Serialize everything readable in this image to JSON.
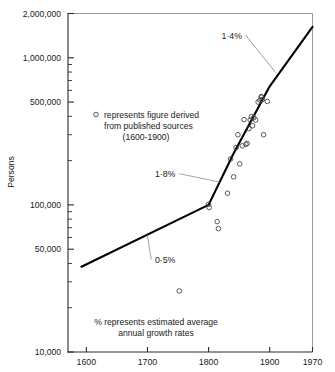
{
  "chart_data": {
    "type": "scatter",
    "title": "",
    "xlabel": "",
    "ylabel": "Persons",
    "yscale": "log",
    "ylim": [
      10000,
      2000000
    ],
    "xlim": [
      1570,
      1970
    ],
    "grid": false,
    "legend_position": "upper-left-inside",
    "ytick_labels": [
      "2,000,000",
      "1,000,000",
      "500,000",
      "100,000",
      "50,000",
      "10,000"
    ],
    "ytick_values": [
      2000000,
      1000000,
      500000,
      100000,
      50000,
      10000
    ],
    "xtick_labels": [
      "1600",
      "1700",
      "1800",
      "1900",
      "1970"
    ],
    "xtick_values": [
      1600,
      1700,
      1800,
      1900,
      1970
    ],
    "series": [
      {
        "name": "trend line",
        "type": "line",
        "points": [
          {
            "x": 1592,
            "y": 38000
          },
          {
            "x": 1800,
            "y": 100000
          },
          {
            "x": 1840,
            "y": 220000
          },
          {
            "x": 1900,
            "y": 640000
          },
          {
            "x": 1970,
            "y": 1620000
          }
        ]
      },
      {
        "name": "figure derived from published sources",
        "type": "scatter",
        "points": [
          {
            "x": 1752,
            "y": 26000
          },
          {
            "x": 1800,
            "y": 101000
          },
          {
            "x": 1801,
            "y": 96000
          },
          {
            "x": 1814,
            "y": 77000
          },
          {
            "x": 1816,
            "y": 69000
          },
          {
            "x": 1831,
            "y": 120000
          },
          {
            "x": 1836,
            "y": 205000
          },
          {
            "x": 1841,
            "y": 155000
          },
          {
            "x": 1845,
            "y": 245000
          },
          {
            "x": 1848,
            "y": 300000
          },
          {
            "x": 1851,
            "y": 190000
          },
          {
            "x": 1855,
            "y": 252000
          },
          {
            "x": 1858,
            "y": 380000
          },
          {
            "x": 1861,
            "y": 258000
          },
          {
            "x": 1863,
            "y": 262000
          },
          {
            "x": 1866,
            "y": 330000
          },
          {
            "x": 1868,
            "y": 378000
          },
          {
            "x": 1870,
            "y": 398000
          },
          {
            "x": 1872,
            "y": 345000
          },
          {
            "x": 1874,
            "y": 392000
          },
          {
            "x": 1877,
            "y": 378000
          },
          {
            "x": 1881,
            "y": 500000
          },
          {
            "x": 1884,
            "y": 515000
          },
          {
            "x": 1886,
            "y": 545000
          },
          {
            "x": 1887,
            "y": 540000
          },
          {
            "x": 1888,
            "y": 520000
          },
          {
            "x": 1890,
            "y": 300000
          },
          {
            "x": 1896,
            "y": 505000
          }
        ]
      }
    ],
    "annotations": [
      {
        "label": "1·4%",
        "text_x": 1838,
        "text_y": 1420000,
        "leader_to_x": 1910,
        "leader_to_y": 790000
      },
      {
        "label": "1·8%",
        "text_x": 1729,
        "text_y": 163000,
        "leader_to_x": 1818,
        "leader_to_y": 143000
      },
      {
        "label": "0·5%",
        "text_x": 1729,
        "text_y": 42500,
        "leader_to_x": 1700,
        "leader_to_y": 62000
      }
    ]
  },
  "legend": {
    "marker_name": "open-circle-marker",
    "line1": "represents figure derived",
    "line2": "from published sources",
    "line3": "(1600-1900)"
  },
  "note": {
    "line1": "% represents estimated average",
    "line2": "annual growth rates"
  },
  "axes": {
    "ylabel": "Persons",
    "ytick_labels": [
      "2,000,000",
      "1,000,000",
      "500,000",
      "100,000",
      "50,000",
      "10,000"
    ],
    "xtick_labels": [
      "1600",
      "1700",
      "1800",
      "1900",
      "1970"
    ]
  },
  "annotation_labels": {
    "rate_top": "1·4%",
    "rate_mid": "1·8%",
    "rate_low": "0·5%"
  },
  "colors": {
    "axis": "#2b2b2b",
    "frame": "#8e8e8e",
    "trend": "#000000",
    "marker": "#3d3d3d",
    "leader": "#8a8a8a",
    "background": "#ffffff"
  }
}
